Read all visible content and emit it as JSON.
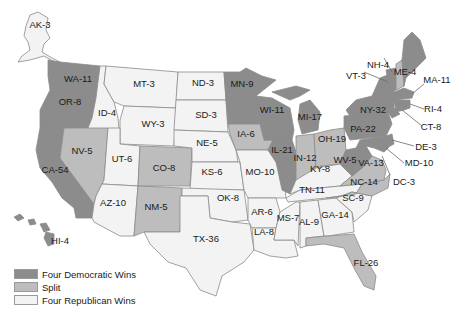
{
  "map": {
    "title": "",
    "colors": {
      "dem": "#8c8c8c",
      "split": "#bdbdbd",
      "rep": "#f3f3f3"
    },
    "states": [
      {
        "abbr": "AK",
        "votes": 3,
        "label": "AK-3",
        "cat": "rep"
      },
      {
        "abbr": "HI",
        "votes": 4,
        "label": "HI-4",
        "cat": "dem"
      },
      {
        "abbr": "WA",
        "votes": 11,
        "label": "WA-11",
        "cat": "dem"
      },
      {
        "abbr": "OR",
        "votes": 8,
        "label": "OR-8",
        "cat": "dem"
      },
      {
        "abbr": "CA",
        "votes": 54,
        "label": "CA-54",
        "cat": "dem"
      },
      {
        "abbr": "ID",
        "votes": 4,
        "label": "ID-4",
        "cat": "rep"
      },
      {
        "abbr": "NV",
        "votes": 5,
        "label": "NV-5",
        "cat": "split"
      },
      {
        "abbr": "MT",
        "votes": 3,
        "label": "MT-3",
        "cat": "rep"
      },
      {
        "abbr": "WY",
        "votes": 3,
        "label": "WY-3",
        "cat": "rep"
      },
      {
        "abbr": "UT",
        "votes": 6,
        "label": "UT-6",
        "cat": "rep"
      },
      {
        "abbr": "AZ",
        "votes": 10,
        "label": "AZ-10",
        "cat": "rep"
      },
      {
        "abbr": "CO",
        "votes": 8,
        "label": "CO-8",
        "cat": "split"
      },
      {
        "abbr": "NM",
        "votes": 5,
        "label": "NM-5",
        "cat": "split"
      },
      {
        "abbr": "ND",
        "votes": 3,
        "label": "ND-3",
        "cat": "rep"
      },
      {
        "abbr": "SD",
        "votes": 3,
        "label": "SD-3",
        "cat": "rep"
      },
      {
        "abbr": "NE",
        "votes": 5,
        "label": "NE-5",
        "cat": "rep"
      },
      {
        "abbr": "KS",
        "votes": 6,
        "label": "KS-6",
        "cat": "rep"
      },
      {
        "abbr": "OK",
        "votes": 8,
        "label": "OK-8",
        "cat": "rep"
      },
      {
        "abbr": "TX",
        "votes": 36,
        "label": "TX-36",
        "cat": "rep"
      },
      {
        "abbr": "MN",
        "votes": 9,
        "label": "MN-9",
        "cat": "dem"
      },
      {
        "abbr": "IA",
        "votes": 6,
        "label": "IA-6",
        "cat": "split"
      },
      {
        "abbr": "MO",
        "votes": 10,
        "label": "MO-10",
        "cat": "rep"
      },
      {
        "abbr": "AR",
        "votes": 6,
        "label": "AR-6",
        "cat": "rep"
      },
      {
        "abbr": "LA",
        "votes": 8,
        "label": "LA-8",
        "cat": "rep"
      },
      {
        "abbr": "WI",
        "votes": 11,
        "label": "WI-11",
        "cat": "dem"
      },
      {
        "abbr": "IL",
        "votes": 21,
        "label": "IL-21",
        "cat": "dem"
      },
      {
        "abbr": "MI",
        "votes": 17,
        "label": "MI-17",
        "cat": "dem"
      },
      {
        "abbr": "IN",
        "votes": 12,
        "label": "IN-12",
        "cat": "split"
      },
      {
        "abbr": "OH",
        "votes": 19,
        "label": "OH-19",
        "cat": "split"
      },
      {
        "abbr": "KY",
        "votes": 8,
        "label": "KY-8",
        "cat": "rep"
      },
      {
        "abbr": "TN",
        "votes": 11,
        "label": "TN-11",
        "cat": "rep"
      },
      {
        "abbr": "MS",
        "votes": 7,
        "label": "MS-7",
        "cat": "rep"
      },
      {
        "abbr": "AL",
        "votes": 9,
        "label": "AL-9",
        "cat": "rep"
      },
      {
        "abbr": "GA",
        "votes": 14,
        "label": "GA-14",
        "cat": "rep"
      },
      {
        "abbr": "FL",
        "votes": 26,
        "label": "FL-26",
        "cat": "split"
      },
      {
        "abbr": "SC",
        "votes": 9,
        "label": "SC-9",
        "cat": "rep"
      },
      {
        "abbr": "NC",
        "votes": 14,
        "label": "NC-14",
        "cat": "split"
      },
      {
        "abbr": "VA",
        "votes": 13,
        "label": "VA-13",
        "cat": "split"
      },
      {
        "abbr": "WV",
        "votes": 5,
        "label": "WV-5",
        "cat": "dem"
      },
      {
        "abbr": "PA",
        "votes": 22,
        "label": "PA-22",
        "cat": "dem"
      },
      {
        "abbr": "NY",
        "votes": 32,
        "label": "NY-32",
        "cat": "dem"
      },
      {
        "abbr": "VT",
        "votes": 3,
        "label": "VT-3",
        "cat": "dem"
      },
      {
        "abbr": "NH",
        "votes": 4,
        "label": "NH-4",
        "cat": "split"
      },
      {
        "abbr": "ME",
        "votes": 4,
        "label": "ME-4",
        "cat": "dem"
      },
      {
        "abbr": "MA",
        "votes": 11,
        "label": "MA-11",
        "cat": "dem"
      },
      {
        "abbr": "RI",
        "votes": 4,
        "label": "RI-4",
        "cat": "dem"
      },
      {
        "abbr": "CT",
        "votes": 8,
        "label": "CT-8",
        "cat": "dem"
      },
      {
        "abbr": "DE",
        "votes": 3,
        "label": "DE-3",
        "cat": "dem"
      },
      {
        "abbr": "MD",
        "votes": 10,
        "label": "MD-10",
        "cat": "dem"
      },
      {
        "abbr": "DC",
        "votes": 3,
        "label": "DC-3",
        "cat": "dem"
      }
    ]
  },
  "legend": {
    "items": [
      {
        "label": "Four Democratic Wins",
        "color": "#8c8c8c"
      },
      {
        "label": "Split",
        "color": "#bdbdbd"
      },
      {
        "label": "Four Republican Wins",
        "color": "#f3f3f3"
      }
    ]
  }
}
